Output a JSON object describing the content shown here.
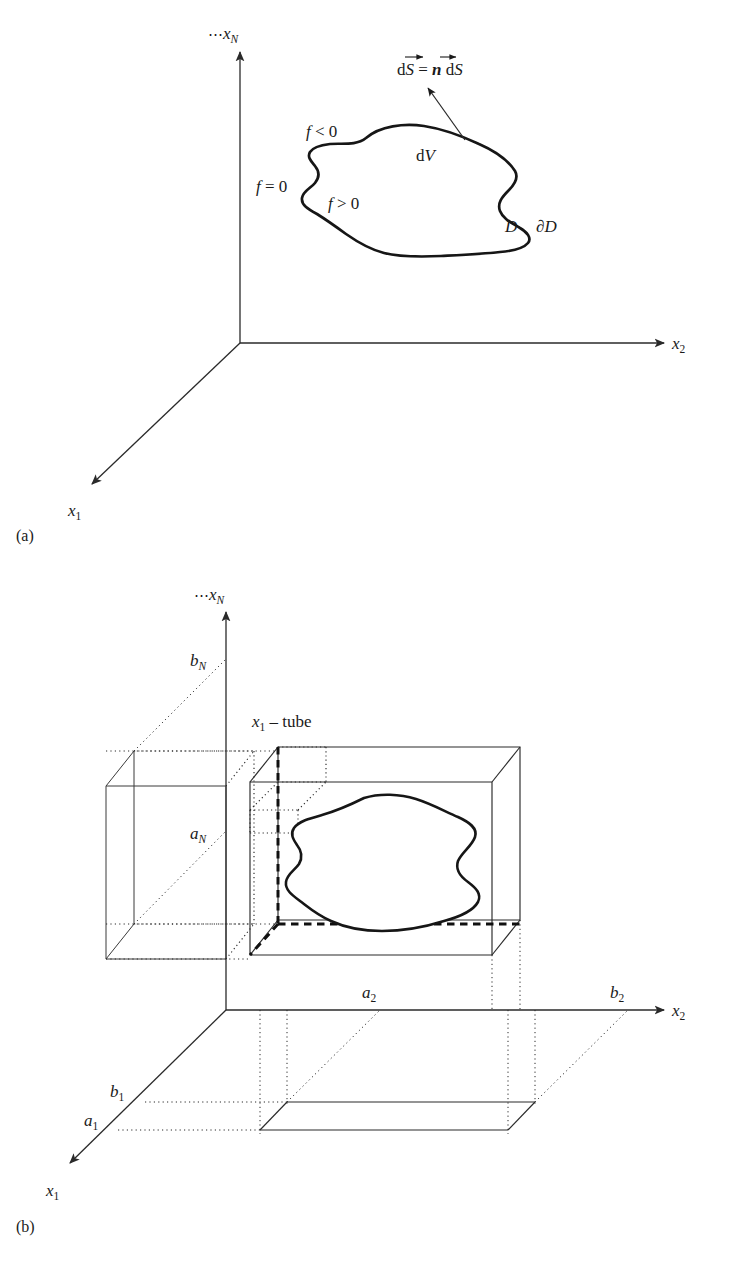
{
  "figure": {
    "panels": [
      {
        "caption": "(a)",
        "axes": [
          {
            "name": "x_N",
            "dots": "⋯",
            "base": "x",
            "sub": "N"
          },
          {
            "name": "x_2",
            "base": "x",
            "sub": "2"
          },
          {
            "name": "x_1",
            "base": "x",
            "sub": "1"
          }
        ],
        "annotations": {
          "flux_lhs": "d",
          "flux_S": "S",
          "flux_eq": " = ",
          "flux_n": "n",
          "flux_rhs": " d",
          "flux_S2": "S",
          "flux_full": "dS⃗ = n⃗ dS",
          "f_neg": "f",
          "f_neg_rel": "< 0",
          "f_zero": "f",
          "f_zero_rel": "= 0",
          "f_pos": "f",
          "f_pos_rel": "> 0",
          "dV_d": "d",
          "dV_V": "V",
          "region": "D",
          "boundary": "∂D"
        }
      },
      {
        "caption": "(b)",
        "axes": [
          {
            "name": "x_N",
            "dots": "⋯",
            "base": "x",
            "sub": "N"
          },
          {
            "name": "x_2",
            "base": "x",
            "sub": "2"
          },
          {
            "name": "x_1",
            "base": "x",
            "sub": "1"
          }
        ],
        "annotations": {
          "tube_x": "x",
          "tube_sub": "1",
          "tube_rest": " – tube",
          "b_N": "b",
          "b_N_sub": "N",
          "a_N": "a",
          "a_N_sub": "N",
          "a_2": "a",
          "a_2_sub": "2",
          "b_2": "b",
          "b_2_sub": "2",
          "b_1": "b",
          "b_1_sub": "1",
          "a_1": "a",
          "a_1_sub": "1"
        }
      }
    ],
    "colors": {
      "ink": "#1a1a1a",
      "line": "#2a2a2a",
      "blob": "#161616",
      "background": "#ffffff"
    }
  }
}
